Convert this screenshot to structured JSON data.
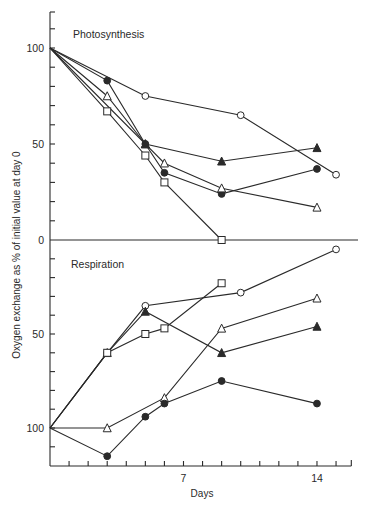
{
  "chart_data": {
    "type": "line",
    "title": "",
    "xlabel": "Days",
    "ylabel": "Oxygen exchange as % of initial value at day 0",
    "x_ticks_labeled": [
      7,
      14
    ],
    "x_range": [
      0,
      15.8
    ],
    "panels": [
      {
        "name": "Photosynthesis",
        "ylim": [
          0,
          118
        ],
        "y_inverted": false,
        "y_ticks_labeled": [
          0,
          50,
          100
        ],
        "series": [
          {
            "marker": "open-circle",
            "x": [
              0,
              5,
              10,
              15
            ],
            "y": [
              100,
              75,
              65,
              34
            ]
          },
          {
            "marker": "filled-circle",
            "x": [
              0,
              3,
              5,
              6,
              9,
              14
            ],
            "y": [
              100,
              83,
              50,
              35,
              24,
              37
            ]
          },
          {
            "marker": "open-triangle",
            "x": [
              0,
              3,
              5,
              6,
              9,
              14
            ],
            "y": [
              100,
              75,
              50,
              40,
              27,
              17
            ]
          },
          {
            "marker": "filled-triangle",
            "x": [
              0,
              5,
              9,
              14
            ],
            "y": [
              100,
              50,
              41,
              48
            ]
          },
          {
            "marker": "open-square",
            "x": [
              0,
              3,
              5,
              6,
              9
            ],
            "y": [
              100,
              67,
              44,
              30,
              0
            ]
          }
        ]
      },
      {
        "name": "Respiration",
        "ylim": [
          0,
          120
        ],
        "y_inverted": true,
        "y_ticks_labeled": [
          50,
          100
        ],
        "series": [
          {
            "marker": "open-circle",
            "x": [
              0,
              3,
              5,
              10,
              15
            ],
            "y": [
              100,
              60,
              35,
              28,
              5
            ]
          },
          {
            "marker": "filled-triangle",
            "x": [
              0,
              3,
              5,
              9,
              14
            ],
            "y": [
              100,
              60,
              38,
              60,
              46
            ]
          },
          {
            "marker": "open-square",
            "x": [
              0,
              3,
              5,
              6,
              9
            ],
            "y": [
              100,
              60,
              50,
              47,
              23
            ]
          },
          {
            "marker": "open-triangle",
            "x": [
              0,
              3,
              6,
              9,
              14
            ],
            "y": [
              100,
              100,
              84,
              47,
              31
            ]
          },
          {
            "marker": "filled-circle",
            "x": [
              0,
              3,
              5,
              6,
              9,
              14
            ],
            "y": [
              100,
              115,
              94,
              87,
              75,
              87
            ]
          }
        ]
      }
    ],
    "grid": false,
    "legend": "none (marker styles only)"
  },
  "labels": {
    "xlabel": "Days",
    "ylabel": "Oxygen exchange as % of initial value at day 0",
    "panel_top": "Photosynthesis",
    "panel_bottom": "Respiration"
  },
  "colors": {
    "ink": "#2a2a2a",
    "background": "#ffffff"
  }
}
